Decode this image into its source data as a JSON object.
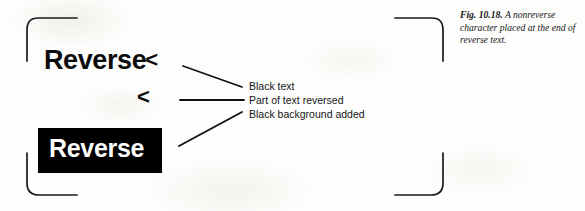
{
  "figure": {
    "caption": {
      "figure_number": "Fig. 10.18.",
      "text": "A nonreverse character placed at the end of reverse text."
    },
    "samples": {
      "normal_text_with_caret": {
        "word": "Reverse",
        "caret": "<"
      },
      "caret_only": {
        "caret": "<"
      },
      "reversed_block": {
        "word": "Reverse"
      }
    },
    "callouts": [
      {
        "label": "Black text"
      },
      {
        "label": "Part of text reversed"
      },
      {
        "label": "Black background added"
      }
    ],
    "colors": {
      "ink": "#0c0c0c",
      "reverse_background": "#000000",
      "reverse_foreground": "#ffffff",
      "page_background": "#fdfdfb",
      "bracket_stroke": "#1a1a1a"
    }
  }
}
